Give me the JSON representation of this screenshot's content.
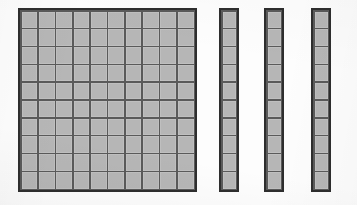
{
  "figure": {
    "kind": "base-ten-blocks",
    "background_color": "#fdfdfd",
    "cell_fill_color": "#b6b6b6",
    "grid_line_color": "#5a5a5a",
    "outline_color": "#2e2e2e"
  },
  "blocks": [
    {
      "name": "hundred-flat",
      "label": "hundred flat",
      "rows": 10,
      "columns": 10,
      "unit_count": 100,
      "place_value": "hundreds",
      "quantity": 1
    },
    {
      "name": "ten-rod-1",
      "label": "ten rod",
      "rows": 10,
      "columns": 1,
      "unit_count": 10,
      "place_value": "tens",
      "quantity": 1
    },
    {
      "name": "ten-rod-2",
      "label": "ten rod",
      "rows": 10,
      "columns": 1,
      "unit_count": 10,
      "place_value": "tens",
      "quantity": 1
    },
    {
      "name": "ten-rod-3",
      "label": "ten rod",
      "rows": 10,
      "columns": 1,
      "unit_count": 10,
      "place_value": "tens",
      "quantity": 1
    }
  ],
  "totals": {
    "flats": 1,
    "rods": 3,
    "units": 0,
    "value": 130
  }
}
